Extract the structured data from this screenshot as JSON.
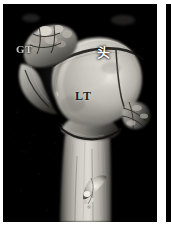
{
  "figure": {
    "modality": "3D CT volume rendering",
    "region": "proximal humerus",
    "background_color": "#000000",
    "frame_color": "#ffffff",
    "background_noise_text": "  .    , .  .   .\n  ..  ,   .  , . .\n .  ,.    . .   ,\n   .  .   .  ."
  },
  "panels": [
    {
      "id": "panel-main",
      "name": "proximal-humerus-3d-ct",
      "x": 3,
      "y": 4,
      "width": 154,
      "height": 218
    },
    {
      "id": "panel-next",
      "name": "adjacent-panel-sliver",
      "x": 166,
      "y": 4,
      "width": 5,
      "height": 218
    }
  ],
  "labels": [
    {
      "id": "gt",
      "text": "GT",
      "meaning": "greater-tuberosity",
      "color": "#cfcfcf",
      "x": 13,
      "y": 39
    },
    {
      "id": "head",
      "text": "头",
      "meaning": "humeral-head",
      "color": "#ffffff",
      "x": 94,
      "y": 38
    },
    {
      "id": "lt",
      "text": "LT",
      "meaning": "lesser-tuberosity",
      "color": "#1b1b1b",
      "x": 72,
      "y": 85
    }
  ],
  "anatomy": {
    "structures": [
      "humeral head",
      "greater tuberosity",
      "lesser tuberosity",
      "bicipital groove",
      "surgical neck",
      "humeral shaft",
      "fracture fragment"
    ]
  }
}
